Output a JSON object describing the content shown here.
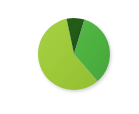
{
  "chart_data": {
    "type": "pie",
    "title": "",
    "xlabel": "",
    "ylabel": "",
    "legend_position": "none",
    "grid": false,
    "labels": [
      "Slice A",
      "Slice B",
      "Slice C"
    ],
    "values": [
      58,
      34,
      8
    ],
    "units": "percent",
    "colors": [
      "#9fc93c",
      "#4caf3f",
      "#1f5e14"
    ],
    "start_angle_deg": -12,
    "direction": "counterclockwise",
    "slices": [
      {
        "label": "Slice A",
        "value": 58,
        "color": "#9fc93c",
        "name": "light-yellow-green-slice"
      },
      {
        "label": "Slice B",
        "value": 34,
        "color": "#4caf3f",
        "name": "medium-green-slice"
      },
      {
        "label": "Slice C",
        "value": 8,
        "color": "#1f5e14",
        "name": "dark-green-slice"
      }
    ]
  },
  "figure": {
    "background_color": "#ffffff",
    "center_x": 74,
    "center_y": 54,
    "radius": 36,
    "shadow_color": "#d8d8d8"
  }
}
